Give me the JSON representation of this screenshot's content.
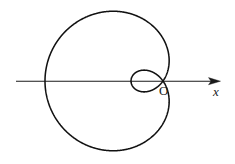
{
  "figure": {
    "background_color": "#ffffff",
    "curve_color": "#111111",
    "axis_color": "#1a1a1a",
    "labels": {
      "origin": "O",
      "x_axis": "x"
    },
    "axis": {
      "name": "x-axis",
      "orientation": "horizontal",
      "y_pixel": 81,
      "x_start": 16,
      "x_end": 220,
      "arrow": "right"
    }
  },
  "chart_data": {
    "type": "line",
    "title": "",
    "subtitle": "",
    "xlabel": "x",
    "ylabel": "",
    "grid": false,
    "legend": null,
    "annotations": [
      {
        "text": "O",
        "x": 0,
        "y": 0,
        "role": "pole-origin"
      },
      {
        "text": "x",
        "x": 57,
        "y": 0,
        "role": "axis-label"
      }
    ],
    "curve": {
      "name": "limacon",
      "polar_equation": "r = a - b*cos(theta)",
      "a": 43,
      "b": 75,
      "has_inner_loop": true,
      "pole_pixel": [
        163,
        81
      ],
      "outer_loop": {
        "leftmost_x": 45,
        "rightmost_x": 175,
        "top_y": 13,
        "bottom_y": 155,
        "max_radius": 118
      },
      "inner_loop": {
        "leftmost_x": 131,
        "rightmost_x": 163,
        "top_y": 70,
        "bottom_y": 93,
        "max_radius": 32
      }
    },
    "series": [
      {
        "name": "limacon-outer",
        "points_polar_deg": [
          [
            0,
            -32
          ],
          [
            15,
            -29.4
          ],
          [
            30,
            -22
          ],
          [
            45,
            -10
          ],
          [
            60,
            5.5
          ],
          [
            75,
            23.6
          ],
          [
            90,
            43
          ],
          [
            105,
            62.4
          ],
          [
            120,
            80.5
          ],
          [
            135,
            96
          ],
          [
            150,
            108
          ],
          [
            165,
            115.4
          ],
          [
            180,
            118
          ],
          [
            195,
            115.4
          ],
          [
            210,
            108
          ],
          [
            225,
            96
          ],
          [
            240,
            80.5
          ],
          [
            255,
            62.4
          ],
          [
            270,
            43
          ],
          [
            285,
            23.6
          ],
          [
            300,
            5.5
          ],
          [
            315,
            -10
          ],
          [
            330,
            -22
          ],
          [
            345,
            -29.4
          ],
          [
            360,
            -32
          ]
        ]
      }
    ],
    "xlim": [
      -118,
      72
    ],
    "ylim": [
      -118,
      118
    ]
  }
}
